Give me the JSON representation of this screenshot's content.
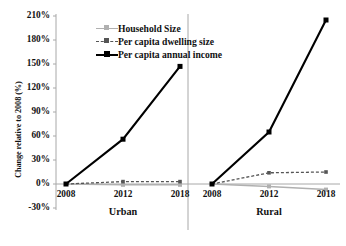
{
  "chart_data": {
    "type": "line",
    "title": "",
    "xlabel": "",
    "ylabel": "Change relative to 2008 (%)",
    "ylim": [
      -30,
      210
    ],
    "yticks": [
      -30,
      0,
      30,
      60,
      90,
      120,
      150,
      180,
      210
    ],
    "ytick_labels": [
      "-30%",
      "0%",
      "30%",
      "60%",
      "90%",
      "120%",
      "150%",
      "180%",
      "210%"
    ],
    "grid": false,
    "legend_position": "upper-left-inside",
    "panels": [
      {
        "name": "Urban",
        "label": "Urban",
        "categories": [
          "2008",
          "2012",
          "2018"
        ],
        "series": [
          {
            "name": "Household Size",
            "values": [
              0,
              -1,
              -1
            ]
          },
          {
            "name": "Per capita dwelling size",
            "values": [
              0,
              3,
              3
            ]
          },
          {
            "name": "Per capita annual income",
            "values": [
              0,
              56,
              147
            ]
          }
        ]
      },
      {
        "name": "Rural",
        "label": "Rural",
        "categories": [
          "2008",
          "2012",
          "2018"
        ],
        "series": [
          {
            "name": "Household Size",
            "values": [
              0,
              -3,
              -7
            ]
          },
          {
            "name": "Per capita dwelling size",
            "values": [
              0,
              14,
              15
            ]
          },
          {
            "name": "Per capita annual income",
            "values": [
              0,
              65,
              205
            ]
          }
        ]
      }
    ],
    "legend": [
      {
        "label": "Household Size",
        "color": "#b0b0b0",
        "style": "solid",
        "marker": "square"
      },
      {
        "label": "Per capita dwelling size",
        "color": "#555555",
        "style": "dashed",
        "marker": "square"
      },
      {
        "label": "Per capita annual income",
        "color": "#000000",
        "style": "solid",
        "marker": "square"
      }
    ]
  },
  "colors": {
    "household": "#b0b0b0",
    "dwelling": "#555555",
    "income": "#000000",
    "axis": "#a8a8a8",
    "text": "#111111",
    "background": "#ffffff"
  }
}
